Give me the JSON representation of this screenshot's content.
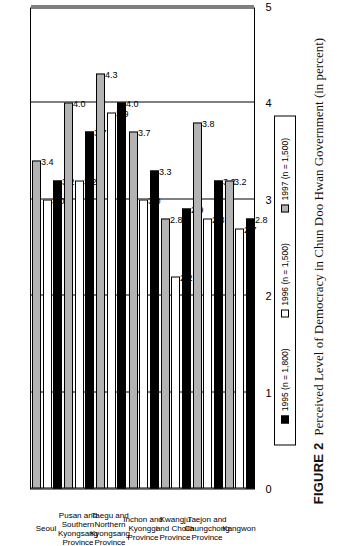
{
  "caption": {
    "figure_number": "FIGURE 2",
    "text": "Perceived Level of Democracy in Chun Doo Hwan Government (in percent)"
  },
  "legend": {
    "entries": [
      {
        "label": "1995 (n = 1,800)",
        "color": "#000000",
        "series": "1995"
      },
      {
        "label": "1996 (n = 1,500)",
        "color": "#ffffff",
        "series": "1996"
      },
      {
        "label": "1997 (n = 1,500)",
        "color": "#b3b3b3",
        "series": "1997"
      }
    ]
  },
  "axis": {
    "ticks": [
      "0",
      "1",
      "2",
      "3",
      "4",
      "5"
    ]
  },
  "categories": [
    {
      "line1": "Seoul",
      "line2": "",
      "line3": ""
    },
    {
      "line1": "Pusan and",
      "line2": "Southern",
      "line3": "Kyongsang\nProvince"
    },
    {
      "line1": "Taegu and",
      "line2": "Northern",
      "line3": "Kyongsang\nProvince"
    },
    {
      "line1": "Inchon and",
      "line2": "Kyonggi",
      "line3": "Province"
    },
    {
      "line1": "Kwangju",
      "line2": "and Cholla",
      "line3": "Province"
    },
    {
      "line1": "Taejon and",
      "line2": "Chungchong",
      "line3": "Province"
    },
    {
      "line1": "Kangwon",
      "line2": "",
      "line3": ""
    }
  ],
  "chart_data": {
    "type": "bar",
    "orientation": "horizontal",
    "title": "Perceived Level of Democracy in Chun Doo Hwan Government (in percent)",
    "xlabel": "",
    "ylabel": "",
    "xlim": [
      0,
      5
    ],
    "grid": true,
    "legend_position": "bottom",
    "categories": [
      "Seoul",
      "Pusan and Southern Kyongsang Province",
      "Taegu and Northern Kyongsang Province",
      "Inchon and Kyonggi Province",
      "Kwangju and Cholla Province",
      "Taejon and Chungchong Province",
      "Kangwon"
    ],
    "series": [
      {
        "name": "1995 (n = 1,800)",
        "color": "#000000",
        "values": [
          3.2,
          3.7,
          4.0,
          3.3,
          2.9,
          3.2,
          2.8
        ]
      },
      {
        "name": "1996 (n = 1,500)",
        "color": "#ffffff",
        "values": [
          3.0,
          3.2,
          3.9,
          3.0,
          2.2,
          2.8,
          2.7
        ]
      },
      {
        "name": "1997 (n = 1,500)",
        "color": "#b3b3b3",
        "values": [
          3.4,
          4.0,
          4.3,
          3.7,
          2.8,
          3.8,
          3.2
        ]
      }
    ],
    "ticks": [
      0,
      1,
      2,
      3,
      4,
      5
    ]
  }
}
